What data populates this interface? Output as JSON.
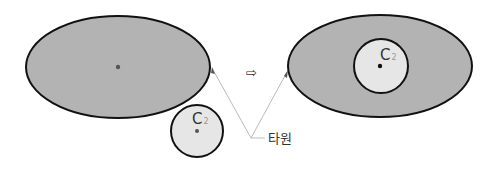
{
  "diagram": {
    "left": {
      "ellipse": {
        "cx": 118,
        "cy": 67,
        "rx": 92,
        "ry": 51,
        "fill": "#b3b3b3",
        "stroke": "#111111"
      },
      "circle": {
        "cx": 197,
        "cy": 131,
        "r": 26,
        "fill": "#e6e6e6",
        "stroke": "#111111",
        "label": "C",
        "subscript": "2"
      }
    },
    "arrow": {
      "glyph": "⇨",
      "x": 252,
      "y": 77
    },
    "right": {
      "ellipse": {
        "cx": 380,
        "cy": 66,
        "rx": 92,
        "ry": 51,
        "fill": "#b3b3b3",
        "stroke": "#111111"
      },
      "circle": {
        "cx": 381,
        "cy": 66,
        "r": 27,
        "fill": "#e6e6e6",
        "stroke": "#111111",
        "label": "C",
        "subscript": "2"
      }
    },
    "callout": {
      "label": "타원",
      "line_color": "#bbbbbb"
    },
    "colors": {
      "outer_fill": "#b3b3b3",
      "inner_fill": "#e6e6e6",
      "stroke": "#111111",
      "dot": "#555555"
    }
  }
}
